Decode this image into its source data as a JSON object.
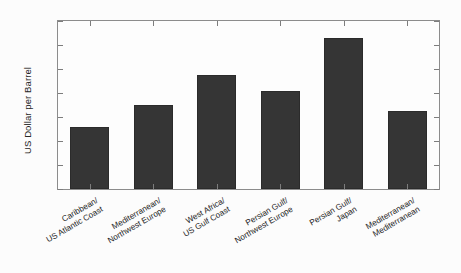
{
  "chart_data": {
    "type": "bar",
    "title": "",
    "subtitle": "",
    "xlabel": "",
    "ylabel": "US Dollar per Barrel",
    "categories": [
      "Caribbean/ US Atlantic Coast",
      "Mediterranean/ Northwest Europe",
      "West Africa/ US Gulf Coast",
      "Persian Gulf/ Northwest Europe",
      "Persian Gulf/ Japan",
      "Mediterranean/ Mediterranean"
    ],
    "category_lines": [
      [
        "Caribbean/",
        "US Atlantic Coast"
      ],
      [
        "Mediterranean/",
        "Northwest Europe"
      ],
      [
        "West Africa/",
        "US Gulf Coast"
      ],
      [
        "Persian Gulf/",
        "Northwest Europe"
      ],
      [
        "Persian Gulf/",
        "Japan"
      ],
      [
        "Mediterranean/",
        "Mediterranean"
      ]
    ],
    "values": [
      1.3,
      1.76,
      2.37,
      2.05,
      3.15,
      1.63
    ],
    "ylim": [
      0,
      3.5
    ],
    "yticks": [
      0,
      0.5,
      1,
      1.5,
      2,
      2.5,
      3,
      3.5
    ],
    "ytick_labels": [
      "0",
      "0.5",
      "1",
      "1.5",
      "2",
      "2.5",
      "3",
      "3.5"
    ],
    "grid": false,
    "legend": null,
    "bar_color": "#353535",
    "axis_color": "#8c8c8c",
    "background_color": "#fcfcfc",
    "xlabel_rotation": -30
  }
}
